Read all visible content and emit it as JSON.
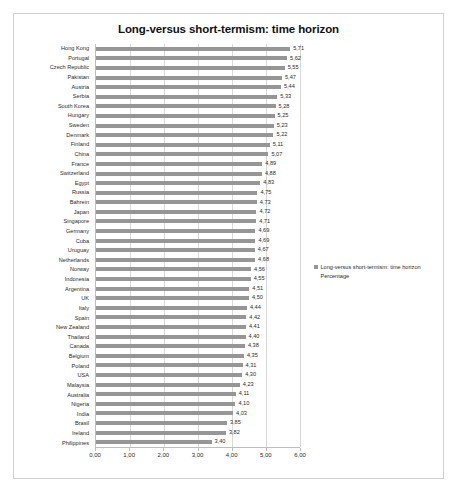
{
  "chart_data": {
    "type": "bar",
    "orientation": "horizontal",
    "title": "Long-versus short-termism: time horizon",
    "xlabel": "",
    "ylabel": "",
    "xlim": [
      0,
      6
    ],
    "xticks": [
      "0,00",
      "1,00",
      "2,00",
      "3,00",
      "4,00",
      "5,00",
      "6,00"
    ],
    "xtick_values": [
      0,
      1,
      2,
      3,
      4,
      5,
      6
    ],
    "grid": true,
    "legend_position": "right",
    "legend": [
      "Long-versus short-termism: time horizon Percentage"
    ],
    "series_name": "Long-versus short-termism: time horizon Percentage",
    "bar_color": "#969696",
    "categories": [
      "Hong Kong",
      "Portugal",
      "Czech Republic",
      "Pakistan",
      "Austria",
      "Serbia",
      "South Korea",
      "Hungary",
      "Sweden",
      "Denmark",
      "Finland",
      "China",
      "France",
      "Switzerland",
      "Egypt",
      "Russia",
      "Bahrein",
      "Japan",
      "Singapore",
      "Germany",
      "Cuba",
      "Uruguay",
      "Netherlands",
      "Norway",
      "Indonesia",
      "Argentina",
      "UK",
      "Italy",
      "Spain",
      "New Zealand",
      "Thailand",
      "Canada",
      "Belgium",
      "Poland",
      "USA",
      "Malaysia",
      "Australia",
      "Nigeria",
      "India",
      "Brasil",
      "Ireland",
      "Philippines"
    ],
    "values": [
      5.71,
      5.62,
      5.55,
      5.47,
      5.44,
      5.33,
      5.28,
      5.25,
      5.23,
      5.22,
      5.11,
      5.07,
      4.89,
      4.88,
      4.83,
      4.75,
      4.73,
      4.72,
      4.71,
      4.69,
      4.69,
      4.67,
      4.68,
      4.56,
      4.55,
      4.51,
      4.5,
      4.44,
      4.42,
      4.41,
      4.4,
      4.38,
      4.35,
      4.31,
      4.3,
      4.23,
      4.11,
      4.1,
      4.03,
      3.85,
      3.82,
      3.4
    ],
    "value_labels": [
      "5,71",
      "5,62",
      "5,55",
      "5,47",
      "5,44",
      "5,33",
      "5,28",
      "5,25",
      "5,23",
      "5,22",
      "5,11",
      "5,07",
      "4,89",
      "4,88",
      "4,83",
      "4,75",
      "4,73",
      "4,72",
      "4,71",
      "4,69",
      "4,69",
      "4,67",
      "4,68",
      "4,56",
      "4,55",
      "4,51",
      "4,50",
      "4,44",
      "4,42",
      "4,41",
      "4,40",
      "4,38",
      "4,35",
      "4,31",
      "4,30",
      "4,23",
      "4,11",
      "4,10",
      "4,03",
      "3,85",
      "3,82",
      "3,40"
    ]
  }
}
